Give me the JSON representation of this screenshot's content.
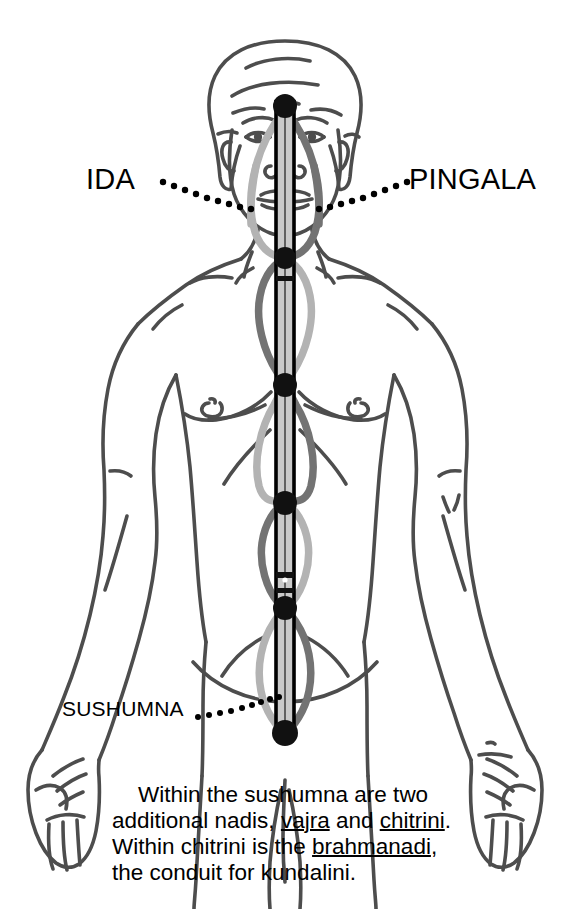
{
  "diagram": {
    "labels": {
      "ida": "IDA",
      "pingala": "PINGALA",
      "sushumna": "SUSHUMNA"
    },
    "caption": {
      "line1": "Within the sushumna are two",
      "line2_a": "additional nadis, ",
      "line2_vajra": "vajra",
      "line2_b": " and ",
      "line2_chitrini": "chitrini",
      "line2_c": ".",
      "line3_a": "Within chitrini is the ",
      "line3_brahmanadi": "brahmanadi",
      "line3_b": ",",
      "line4": "the conduit for kundalini."
    },
    "colors": {
      "background": "#ffffff",
      "body_outline": "#4d4d4d",
      "ida_channel": "#b3b3b3",
      "pingala_channel": "#737373",
      "sushumna_fill": "#c9c9c9",
      "sushumna_border": "#000000",
      "chakra_dot": "#111111",
      "text": "#000000"
    },
    "chakras": [
      {
        "name": "crown",
        "x": 285,
        "y": 106,
        "r": 12
      },
      {
        "name": "throat",
        "x": 285,
        "y": 258,
        "r": 11
      },
      {
        "name": "heart",
        "x": 285,
        "y": 385,
        "r": 12
      },
      {
        "name": "solar-plexus",
        "x": 285,
        "y": 503,
        "r": 12
      },
      {
        "name": "sacral",
        "x": 285,
        "y": 608,
        "r": 12
      },
      {
        "name": "root",
        "x": 285,
        "y": 733,
        "r": 13
      }
    ]
  }
}
